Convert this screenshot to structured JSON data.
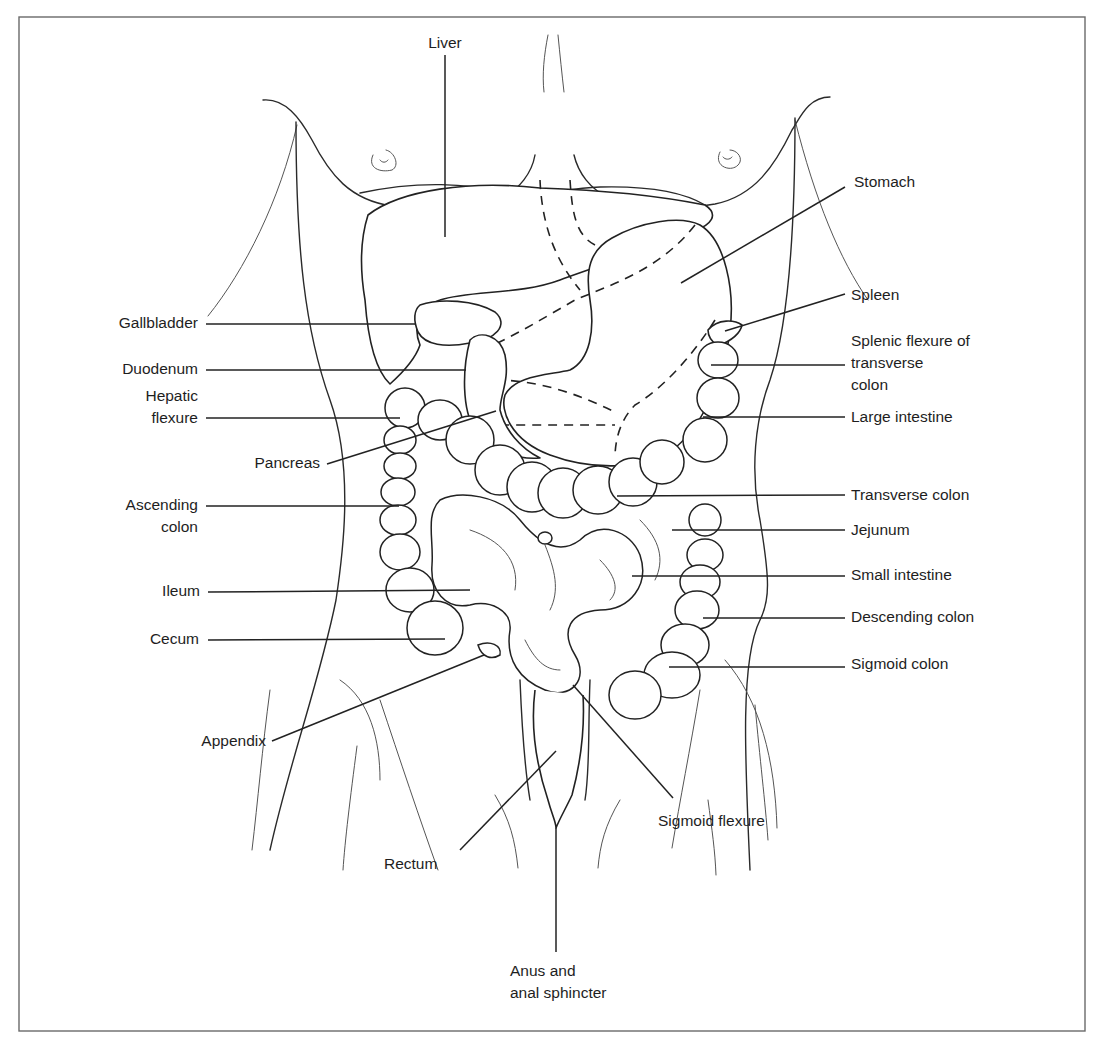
{
  "figure": {
    "frame": {
      "x": 19,
      "y": 17,
      "w": 1066,
      "h": 1014
    },
    "labels": [
      {
        "id": "liver",
        "text": "Liver",
        "x": 422,
        "y": 32,
        "align": "center",
        "w": 46,
        "line": [
          445,
          55,
          445,
          237
        ]
      },
      {
        "id": "stomach",
        "text": "Stomach",
        "x": 854,
        "y": 171,
        "align": "left",
        "w": 100,
        "line": [
          845,
          187,
          681,
          283
        ]
      },
      {
        "id": "spleen",
        "text": "Spleen",
        "x": 851,
        "y": 284,
        "align": "left",
        "w": 100,
        "line": [
          845,
          294,
          725,
          331
        ]
      },
      {
        "id": "gallbladder",
        "text": "Gallbladder",
        "x": 98,
        "y": 312,
        "align": "right",
        "w": 100,
        "line": [
          206,
          324,
          415,
          324
        ]
      },
      {
        "id": "splenic-flexure",
        "text": "Splenic flexure of\ntransverse\ncolon",
        "x": 851,
        "y": 330,
        "align": "left",
        "w": 170,
        "line": [
          845,
          365,
          711,
          365
        ]
      },
      {
        "id": "duodenum",
        "text": "Duodenum",
        "x": 98,
        "y": 358,
        "align": "right",
        "w": 100,
        "line": [
          206,
          370,
          466,
          370
        ]
      },
      {
        "id": "hepatic-flexure",
        "text": "Hepatic\nflexure",
        "x": 98,
        "y": 385,
        "align": "right",
        "w": 100,
        "line": [
          206,
          418,
          400,
          418
        ]
      },
      {
        "id": "large-intestine",
        "text": "Large intestine",
        "x": 851,
        "y": 406,
        "align": "left",
        "w": 140,
        "line": [
          845,
          417,
          703,
          417
        ]
      },
      {
        "id": "pancreas",
        "text": "Pancreas",
        "x": 222,
        "y": 452,
        "align": "right",
        "w": 98,
        "line": [
          327,
          464,
          496,
          411
        ]
      },
      {
        "id": "transverse-colon",
        "text": "Transverse colon",
        "x": 851,
        "y": 484,
        "align": "left",
        "w": 160,
        "line": [
          845,
          495,
          617,
          496
        ]
      },
      {
        "id": "ascending-colon",
        "text": "Ascending\ncolon",
        "x": 98,
        "y": 494,
        "align": "right",
        "w": 100,
        "line": [
          206,
          506,
          399,
          506
        ]
      },
      {
        "id": "jejunum",
        "text": "Jejunum",
        "x": 851,
        "y": 519,
        "align": "left",
        "w": 100,
        "line": [
          845,
          530,
          672,
          530
        ]
      },
      {
        "id": "small-intestine",
        "text": "Small intestine",
        "x": 851,
        "y": 564,
        "align": "left",
        "w": 140,
        "line": [
          845,
          576,
          632,
          576
        ]
      },
      {
        "id": "ileum",
        "text": "Ileum",
        "x": 98,
        "y": 580,
        "align": "right",
        "w": 102,
        "line": [
          208,
          592,
          470,
          590
        ]
      },
      {
        "id": "descending-colon",
        "text": "Descending colon",
        "x": 851,
        "y": 606,
        "align": "left",
        "w": 170,
        "line": [
          845,
          618,
          703,
          618
        ]
      },
      {
        "id": "cecum",
        "text": "Cecum",
        "x": 98,
        "y": 628,
        "align": "right",
        "w": 101,
        "line": [
          208,
          640,
          445,
          639
        ]
      },
      {
        "id": "sigmoid-colon",
        "text": "Sigmoid colon",
        "x": 851,
        "y": 653,
        "align": "left",
        "w": 140,
        "line": [
          845,
          667,
          669,
          667
        ]
      },
      {
        "id": "appendix",
        "text": "Appendix",
        "x": 170,
        "y": 730,
        "align": "right",
        "w": 96,
        "line": [
          272,
          741,
          484,
          655
        ]
      },
      {
        "id": "rectum",
        "text": "Rectum",
        "x": 384,
        "y": 853,
        "align": "left",
        "w": 80,
        "line": [
          460,
          850,
          556,
          751
        ]
      },
      {
        "id": "sigmoid-flexure",
        "text": "Sigmoid flexure",
        "x": 658,
        "y": 810,
        "align": "left",
        "w": 140,
        "line": [
          673,
          798,
          573,
          685
        ]
      },
      {
        "id": "anus",
        "text": "Anus and\nanal sphincter",
        "x": 510,
        "y": 960,
        "align": "left",
        "w": 130,
        "line": [
          556,
          828,
          556,
          952
        ]
      }
    ]
  }
}
